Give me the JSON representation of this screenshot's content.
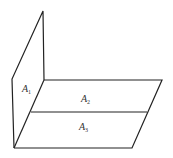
{
  "diagram": {
    "stroke_color": "#222222",
    "background": "#ffffff",
    "regions": [
      {
        "id": "A1",
        "letter": "A",
        "subscript": "1",
        "x": 27,
        "y": 89
      },
      {
        "id": "A2",
        "letter": "A",
        "subscript": "2",
        "x": 84,
        "y": 102
      },
      {
        "id": "A3",
        "letter": "A",
        "subscript": "3",
        "x": 82,
        "y": 131
      }
    ]
  }
}
